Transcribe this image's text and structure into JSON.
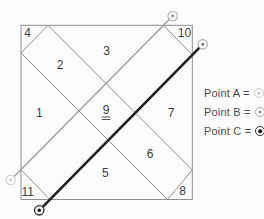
{
  "diagram": {
    "regions": [
      {
        "label": "1"
      },
      {
        "label": "2"
      },
      {
        "label": "3"
      },
      {
        "label": "4"
      },
      {
        "label": "5"
      },
      {
        "label": "6"
      },
      {
        "label": "7"
      },
      {
        "label": "8"
      },
      {
        "label": "9",
        "note_visible": "double underline below the 9"
      },
      {
        "label": "10"
      },
      {
        "label": "11"
      }
    ],
    "markers": [
      {
        "position": "outside-bottom-left",
        "style": "light"
      },
      {
        "position": "outside-top-right-upper",
        "style": "medium"
      },
      {
        "position": "outside-top-right-lower",
        "style": "medium"
      },
      {
        "position": "outside-bottom",
        "style": "dark"
      }
    ]
  },
  "legend": {
    "items": [
      {
        "label": "Point A =",
        "style": "light"
      },
      {
        "label": "Point B =",
        "style": "medium"
      },
      {
        "label": "Point C =",
        "style": "dark"
      }
    ]
  },
  "colors": {
    "thin_line": "#8f8f8f",
    "gray_line": "#9b9b9b",
    "black_line": "#1f1f1f",
    "marker_light": "#cbcbcb",
    "marker_medium": "#a9a9a9",
    "marker_dark": "#2b2b2b",
    "label_text": "#3d3d3d"
  }
}
